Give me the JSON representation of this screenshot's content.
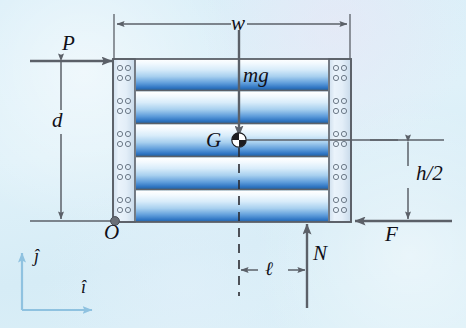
{
  "figure": {
    "background_color": "#dcf0f8"
  },
  "dimensions": {
    "width_label": "w",
    "height_from_ground_label": "d",
    "half_height_label": "h/2",
    "offset_label": "ℓ"
  },
  "forces": {
    "applied_label": "P",
    "weight_label": "mg",
    "normal_label": "N",
    "friction_label": "F"
  },
  "points": {
    "origin_label": "O",
    "center_of_gravity_label": "G"
  },
  "axes": {
    "i_label": "î",
    "j_label": "ĵ"
  },
  "colors": {
    "line": "#5b6068",
    "text": "#111018",
    "pipe_blue": "#2f74c0",
    "pipe_light": "#f4fbff",
    "rail_fill": "#dfeaf5",
    "axis_blue": "#8fc2e0",
    "background": "#dcf0f8"
  },
  "body": {
    "rail_hole_rows": 10,
    "pipe_layer_count": 5
  }
}
